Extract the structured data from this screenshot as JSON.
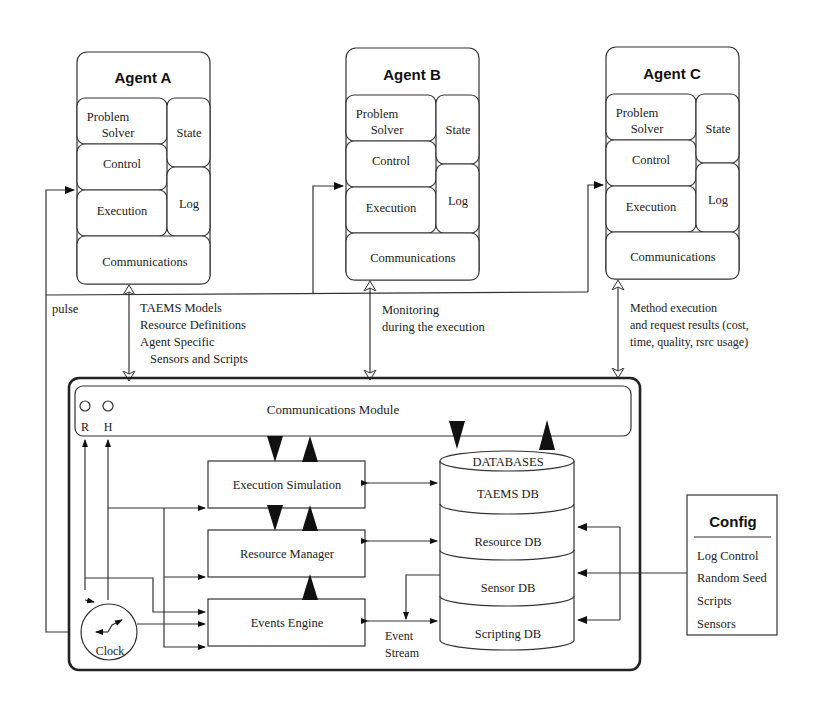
{
  "agents": [
    {
      "title": "Agent A",
      "problem_solver_1": "Problem",
      "problem_solver_2": "Solver",
      "control": "Control",
      "execution": "Execution",
      "state": "State",
      "log": "Log",
      "communications": "Communications"
    },
    {
      "title": "Agent B",
      "problem_solver_1": "Problem",
      "problem_solver_2": "Solver",
      "control": "Control",
      "execution": "Execution",
      "state": "State",
      "log": "Log",
      "communications": "Communications"
    },
    {
      "title": "Agent C",
      "problem_solver_1": "Problem",
      "problem_solver_2": "Solver",
      "control": "Control",
      "execution": "Execution",
      "state": "State",
      "log": "Log",
      "communications": "Communications"
    }
  ],
  "labels": {
    "pulse": "pulse",
    "agent_a_link": [
      "TAEMS Models",
      "Resource Definitions",
      "Agent Specific",
      "Sensors and Scripts"
    ],
    "agent_b_link": [
      "Monitoring",
      "during the execution"
    ],
    "agent_c_link": [
      "Method execution",
      "and request results (cost,",
      "time, quality, rsrc usage)"
    ]
  },
  "simulator": {
    "comm_module": "Communications Module",
    "r_label": "R",
    "h_label": "H",
    "execution_simulation": "Execution Simulation",
    "resource_manager": "Resource Manager",
    "events_engine": "Events Engine",
    "event_stream_1": "Event",
    "event_stream_2": "Stream",
    "clock": "Clock",
    "databases": {
      "title": "DATABASES",
      "items": [
        "TAEMS DB",
        "Resource DB",
        "Sensor DB",
        "Scripting DB"
      ]
    }
  },
  "config": {
    "title": "Config",
    "items": [
      "Log Control",
      "Random Seed",
      "Scripts",
      "Sensors"
    ]
  }
}
